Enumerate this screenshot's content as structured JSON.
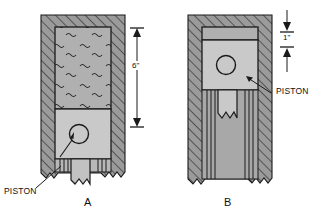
{
  "figure": {
    "title": "",
    "type": "engineering-cross-section"
  },
  "colors": {
    "cylinder_wall": "#9b9b9b",
    "hatch_line": "#3a3a3a",
    "piston_face": "#c9c9c9",
    "gas_region": "#b0b0b0",
    "rod": "#c2c2c2",
    "outline": "#1a1a1a",
    "text": "#111111",
    "background": "#ffffff"
  },
  "panels": [
    {
      "id": "A",
      "caption": "A",
      "piston_label": "PISTON",
      "dimension": {
        "value": "6\"",
        "label": "6\"",
        "orientation": "vertical",
        "measures": "trapped-air-column-height"
      },
      "gas_region": {
        "fill_pattern": "squiggles",
        "meaning": "trapped air"
      },
      "piston_position": "low"
    },
    {
      "id": "B",
      "caption": "B",
      "piston_label": "PISTON",
      "dimension": {
        "value": "1\"",
        "label": "1\"",
        "orientation": "vertical",
        "measures": "compressed-air-column-height"
      },
      "gas_region": {
        "fill_pattern": "none",
        "meaning": "compressed air"
      },
      "piston_position": "high"
    }
  ],
  "labels": {
    "piston_a": "PISTON",
    "piston_b": "PISTON",
    "caption_a": "A",
    "caption_b": "B",
    "dim_a": "6\"",
    "dim_b": "1\""
  }
}
